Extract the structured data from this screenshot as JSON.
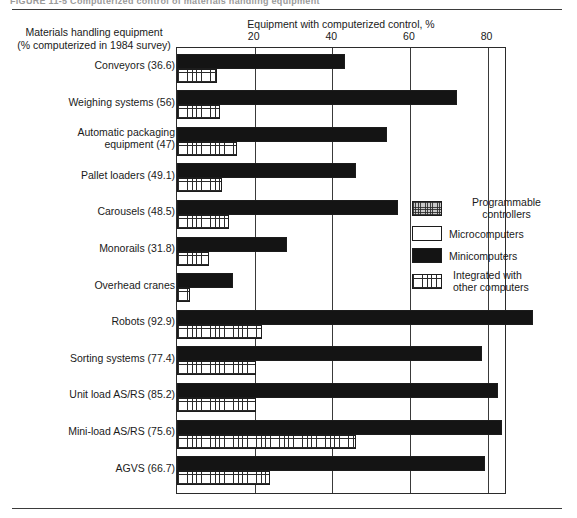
{
  "figure": {
    "caption_fragment": "FIGURE 11-5   Computerized control of materials handling equipment"
  },
  "axis": {
    "y_title_line1": "Materials handling equipment",
    "y_title_line2": "(% computerized in 1984 survey)",
    "x_title": "Equipment with computerized control, %"
  },
  "legend": {
    "items": [
      {
        "label_line1": "Programmable",
        "label_line2": "controllers",
        "swatch": "crosshatch-gray-swatch",
        "color": "#c9c9c9"
      },
      {
        "label_line1": "Microcomputers",
        "label_line2": "",
        "swatch": "white-swatch",
        "color": "#ffffff"
      },
      {
        "label_line1": "Minicomputers",
        "label_line2": "",
        "swatch": "black-swatch",
        "color": "#141414"
      },
      {
        "label_line1": "Integrated with",
        "label_line2": "other computers",
        "swatch": "grid-hatch-swatch",
        "color": "#ffffff"
      }
    ]
  },
  "chart_data": {
    "type": "bar",
    "orientation": "horizontal",
    "title": "Computerized control of materials handling equipment",
    "xlabel": "Equipment with computerized control, %",
    "ylabel": "Materials handling equipment (% computerized in 1984 survey)",
    "xlim": [
      0,
      85
    ],
    "xticks": [
      20,
      40,
      60,
      80
    ],
    "xticklabels": [
      "20",
      "40",
      "60",
      "80"
    ],
    "grid": true,
    "legend_position": "right-middle",
    "categories": [
      "Conveyors (36.6)",
      "Weighing systems (56)",
      "Automatic packaging equipment (47)",
      "Pallet loaders (49.1)",
      "Carousels (48.5)",
      "Monorails (31.8)",
      "Overhead cranes",
      "Robots (92.9)",
      "Sorting systems (77.4)",
      "Unit load AS/RS (85.2)",
      "Mini-load AS/RS (75.6)",
      "AGVS (66.7)"
    ],
    "category_labels": [
      {
        "line1": "Conveyors (36.6)",
        "line2": ""
      },
      {
        "line1": "Weighing systems (56)",
        "line2": ""
      },
      {
        "line1": "Automatic packaging",
        "line2": "equipment (47)"
      },
      {
        "line1": "Pallet loaders (49.1)",
        "line2": ""
      },
      {
        "line1": "Carousels (48.5)",
        "line2": ""
      },
      {
        "line1": "Monorails (31.8)",
        "line2": ""
      },
      {
        "line1": "Overhead cranes",
        "line2": ""
      },
      {
        "line1": "Robots (92.9)",
        "line2": ""
      },
      {
        "line1": "Sorting systems (77.4)",
        "line2": ""
      },
      {
        "line1": "Unit load AS/RS (85.2)",
        "line2": ""
      },
      {
        "line1": "Mini-load AS/RS (75.6)",
        "line2": ""
      },
      {
        "line1": "AGVS (66.7)",
        "line2": ""
      }
    ],
    "series": [
      {
        "name": "Programmable controllers",
        "values": [
          30.6,
          32.8,
          39.3,
          39.5,
          32.3,
          18.8,
          10.8,
          56.5,
          45.0,
          45.4,
          28.6,
          51.9
        ]
      },
      {
        "name": "Microcomputers",
        "values": [
          36.5,
          58.4,
          48.8,
          42.0,
          44.9,
          25.0,
          11.8,
          81.0,
          67.8,
          67.8,
          53.2,
          64.8
        ]
      },
      {
        "name": "Minicomputers",
        "values": [
          43.3,
          72.0,
          54.0,
          46.2,
          56.8,
          28.3,
          14.4,
          91.8,
          78.6,
          82.8,
          83.6,
          79.3
        ]
      },
      {
        "name": "Integrated with other computers",
        "values": [
          10.2,
          11.2,
          15.5,
          11.6,
          13.5,
          8.3,
          3.3,
          21.8,
          20.4,
          20.4,
          46.0,
          24.0
        ]
      }
    ],
    "stacking": "cumulative-overlay"
  }
}
